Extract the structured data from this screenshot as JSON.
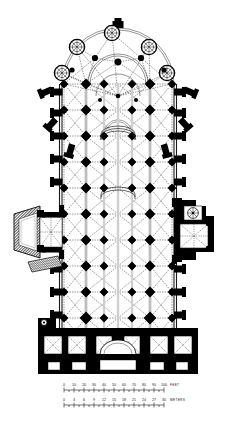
{
  "document": {
    "type": "architectural-floor-plan",
    "subject": "Gothic cathedral plan",
    "orientation": "apse at top, west front at bottom",
    "background_color": "#ffffff",
    "ink_color": "#000000",
    "hatch_color": "#555555"
  },
  "scale_bars": {
    "feet": {
      "unit_label": "FEET",
      "ticks": [
        "0",
        "10",
        "20",
        "30",
        "40",
        "50",
        "60",
        "70",
        "80",
        "90",
        "100"
      ],
      "min": 0,
      "max": 100
    },
    "meters": {
      "unit_label": "METERS",
      "ticks": [
        "0",
        "3",
        "6",
        "9",
        "12",
        "15",
        "18",
        "21",
        "24",
        "27",
        "30"
      ],
      "min": 0,
      "max": 30
    }
  },
  "plan": {
    "bounds": {
      "x": 52,
      "y": 22,
      "width": 132,
      "height": 352
    },
    "nave": {
      "left_wall_x": 62,
      "right_wall_x": 174,
      "top_y": 84,
      "bottom_y": 352,
      "bay_rows_y": [
        84,
        110,
        136,
        162,
        188,
        214,
        240,
        266,
        292,
        318,
        344
      ],
      "pier_cols_x": [
        64,
        86,
        104,
        118,
        132,
        150,
        172
      ]
    },
    "apse": {
      "center_x": 118,
      "center_y": 96,
      "radius": 42,
      "chapel_count": 5,
      "ambulatory_radius": 30
    },
    "radiating_chapels": [
      {
        "angle_deg": 200,
        "cx": 62,
        "cy": 73,
        "r": 7.5
      },
      {
        "angle_deg": 227,
        "cx": 77,
        "cy": 47,
        "r": 7.5
      },
      {
        "angle_deg": 270,
        "cx": 112,
        "cy": 33,
        "r": 7.5
      },
      {
        "angle_deg": 313,
        "cx": 149,
        "cy": 47,
        "r": 7.5
      },
      {
        "angle_deg": 340,
        "cx": 167,
        "cy": 73,
        "r": 7.5
      }
    ],
    "buttresses": {
      "left_y": [
        92,
        113,
        136,
        159,
        182,
        205,
        228,
        251,
        274,
        297,
        320
      ],
      "right_y": [
        92,
        113,
        136,
        159,
        182,
        205,
        228,
        251,
        274,
        297,
        320
      ],
      "apse_angles_deg": [
        188,
        212,
        238,
        265,
        292,
        318,
        344
      ],
      "width": 11,
      "depth": 6
    },
    "transepts": {
      "north_porch": {
        "x": 12,
        "y": 206,
        "width": 50,
        "height": 58,
        "label_role": "west-transept-porch"
      },
      "south_annex": {
        "x": 174,
        "y": 202,
        "width": 48,
        "height": 56,
        "label_role": "east-transept-annex"
      }
    },
    "west_towers": {
      "y": 330,
      "height": 44,
      "left_x": 40,
      "right_x": 156,
      "width": 40
    },
    "crossing": {
      "cx": 118,
      "cy": 232
    },
    "choir_furniture": [
      {
        "cx": 118,
        "cy": 132,
        "rx": 17,
        "ry": 5
      },
      {
        "cx": 118,
        "cy": 196,
        "rx": 17,
        "ry": 5
      }
    ]
  }
}
